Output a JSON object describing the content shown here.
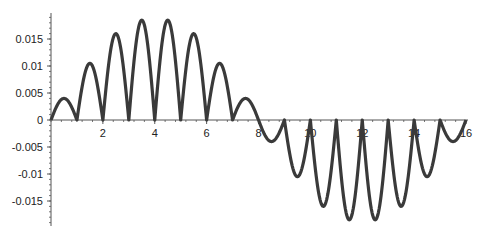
{
  "chart_data": {
    "type": "line",
    "title": "",
    "xlabel": "",
    "ylabel": "",
    "xlim": [
      0,
      16
    ],
    "ylim": [
      -0.019,
      0.019
    ],
    "grid": false,
    "legend": null,
    "x_ticks": [
      "2",
      "4",
      "6",
      "8",
      "10",
      "12",
      "14",
      "16"
    ],
    "y_ticks": [
      "0.015",
      "0.01",
      "0.005",
      "0",
      "-0.005",
      "-0.01",
      "-0.015"
    ],
    "series": [
      {
        "name": "f(x)",
        "color": "#3a3a3a",
        "description": "Arch-shaped lobes between consecutive integers; positive for x in [0,8], negative for x in [8,16]",
        "lobe_intervals": [
          [
            0,
            1
          ],
          [
            1,
            2
          ],
          [
            2,
            3
          ],
          [
            3,
            4
          ],
          [
            4,
            5
          ],
          [
            5,
            6
          ],
          [
            6,
            7
          ],
          [
            7,
            8
          ],
          [
            8,
            9
          ],
          [
            9,
            10
          ],
          [
            10,
            11
          ],
          [
            11,
            12
          ],
          [
            12,
            13
          ],
          [
            13,
            14
          ],
          [
            14,
            15
          ],
          [
            15,
            16
          ]
        ],
        "lobe_extrema": [
          0.004,
          0.0105,
          0.016,
          0.0185,
          0.0185,
          0.016,
          0.0105,
          0.004,
          -0.004,
          -0.0105,
          -0.016,
          -0.0185,
          -0.0185,
          -0.016,
          -0.0105,
          -0.004
        ]
      }
    ]
  }
}
